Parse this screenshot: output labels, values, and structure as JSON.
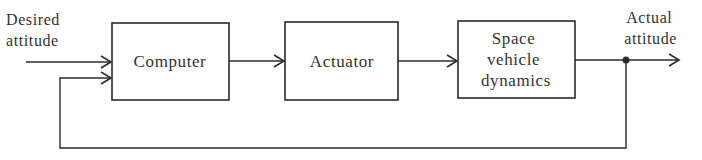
{
  "diagram": {
    "type": "block-diagram",
    "input": {
      "lines": [
        "Desired",
        "attitude"
      ]
    },
    "output": {
      "lines": [
        "Actual",
        "attitude"
      ]
    },
    "blocks": [
      {
        "id": "computer",
        "lines": [
          "Computer"
        ]
      },
      {
        "id": "actuator",
        "lines": [
          "Actuator"
        ]
      },
      {
        "id": "dynamics",
        "lines": [
          "Space",
          "vehicle",
          "dynamics"
        ]
      }
    ],
    "connections": [
      {
        "from": "input",
        "to": "computer"
      },
      {
        "from": "computer",
        "to": "actuator"
      },
      {
        "from": "actuator",
        "to": "dynamics"
      },
      {
        "from": "dynamics",
        "to": "output"
      },
      {
        "from": "output-junction",
        "to": "computer",
        "kind": "feedback"
      }
    ],
    "colors": {
      "stroke": "#2b2b2b",
      "text": "#333333",
      "background": "#ffffff"
    }
  }
}
